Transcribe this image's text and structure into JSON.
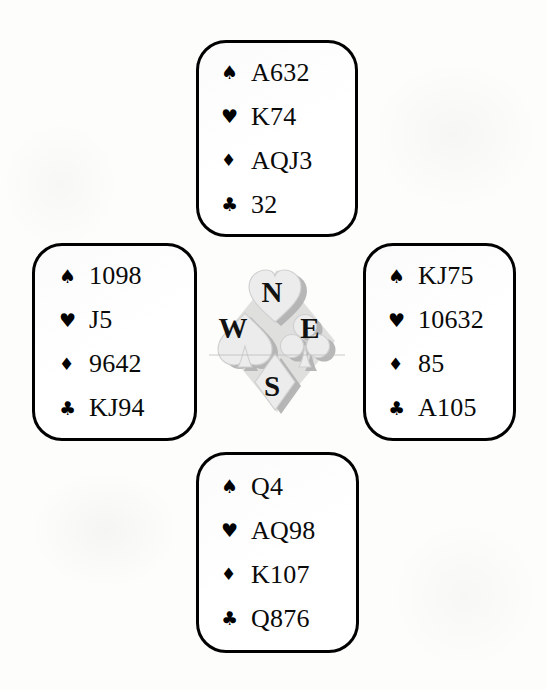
{
  "diagram": {
    "kind": "bridge-deal-diagram",
    "background_color": "#fdfdfb",
    "box_border_color": "#000000",
    "text_color": "#0a0a0a",
    "watermark_color": "#c9c9c9"
  },
  "suit_glyphs": {
    "spade": "♠",
    "heart": "♥",
    "diamond": "♦",
    "club": "♣"
  },
  "compass": {
    "north": "N",
    "west": "W",
    "east": "E",
    "south": "S"
  },
  "hands": {
    "north": {
      "position": "North",
      "spades": "A632",
      "hearts": "K74",
      "diamonds": "AQJ3",
      "clubs": "32"
    },
    "west": {
      "position": "West",
      "spades": "1098",
      "hearts": "J5",
      "diamonds": "9642",
      "clubs": "KJ94"
    },
    "east": {
      "position": "East",
      "spades": "KJ75",
      "hearts": "10632",
      "diamonds": "85",
      "clubs": "A105"
    },
    "south": {
      "position": "South",
      "spades": "Q4",
      "hearts": "AQ98",
      "diamonds": "K107",
      "clubs": "Q876"
    }
  }
}
